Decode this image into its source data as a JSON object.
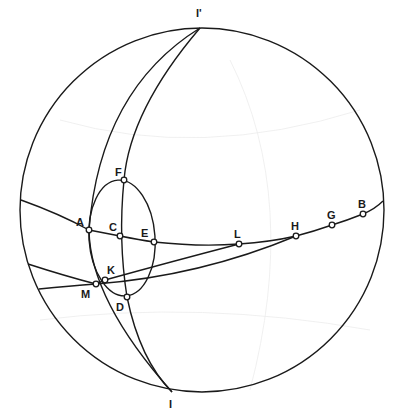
{
  "diagram": {
    "type": "stereographic projection (Wulff net construction)",
    "colors": {
      "line": "#1a1a1a",
      "background": "#ffffff",
      "point_fill": "#ffffff"
    },
    "primitive_circle": {
      "center": [
        202,
        210
      ],
      "radius": 182
    },
    "poles": [
      {
        "id": "I_prime",
        "label": "I'",
        "x": 200,
        "y": 28,
        "label_x": 196,
        "label_y": 17
      },
      {
        "id": "I",
        "label": "I",
        "x": 172,
        "y": 392,
        "label_x": 168,
        "label_y": 408
      }
    ],
    "points": [
      {
        "id": "A",
        "label": "A",
        "x": 89,
        "y": 230,
        "label_x": 75,
        "label_y": 224
      },
      {
        "id": "C",
        "label": "C",
        "x": 120,
        "y": 236,
        "label_x": 109,
        "label_y": 229
      },
      {
        "id": "E",
        "label": "E",
        "x": 154,
        "y": 242,
        "label_x": 142,
        "label_y": 235
      },
      {
        "id": "F",
        "label": "F",
        "x": 124,
        "y": 180,
        "label_x": 116,
        "label_y": 175
      },
      {
        "id": "K",
        "label": "K",
        "x": 105,
        "y": 280,
        "label_x": 107,
        "label_y": 273
      },
      {
        "id": "M",
        "label": "M",
        "x": 96,
        "y": 284,
        "label_x": 82,
        "label_y": 300
      },
      {
        "id": "D",
        "label": "D",
        "x": 127,
        "y": 297,
        "label_x": 116,
        "label_y": 311
      },
      {
        "id": "L",
        "label": "L",
        "x": 239,
        "y": 244,
        "label_x": 234,
        "label_y": 237
      },
      {
        "id": "H",
        "label": "H",
        "x": 296,
        "y": 236,
        "label_x": 291,
        "label_y": 229
      },
      {
        "id": "G",
        "label": "G",
        "x": 332,
        "y": 225,
        "label_x": 327,
        "label_y": 218
      },
      {
        "id": "B",
        "label": "B",
        "x": 363,
        "y": 214,
        "label_x": 358,
        "label_y": 207
      }
    ],
    "curves": [
      {
        "id": "great-circle-ABGH",
        "description": "great circle through A, C, E, L, H, G, B"
      },
      {
        "id": "line-M-K-L",
        "description": "arc from left edge through M, K to L"
      },
      {
        "id": "line-M-H",
        "description": "arc from left edge through M to H"
      },
      {
        "id": "meridian-A-M",
        "description": "great circle I'–A–M–I"
      },
      {
        "id": "meridian-F-C-D",
        "description": "great circle I'–F–C–D–I"
      },
      {
        "id": "small-circle-AFED",
        "description": "small circle through A, F, E, D"
      }
    ]
  }
}
